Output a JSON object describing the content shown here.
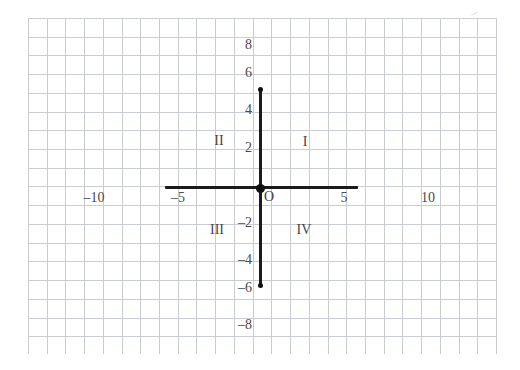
{
  "figure": {
    "background_color": "#ffffff",
    "grid_color": "#c9ccd2",
    "axis_color": "#1b1b1b",
    "label_color": "#4a4a4a"
  },
  "chart_data": {
    "type": "scatter",
    "title": "",
    "subtitle": "",
    "xlabel": "",
    "ylabel": "",
    "xlim": [
      -12.4,
      12.6
    ],
    "ylim": [
      -9.1,
      9.1
    ],
    "grid": true,
    "grid_spacing_units": 1,
    "legend": null,
    "origin_label": "O",
    "x_axis": {
      "drawn_from": -5,
      "drawn_to": 5,
      "tick_values": [
        -10,
        -5,
        5,
        10
      ],
      "tick_labels": [
        "–10",
        "–5",
        "5",
        "10"
      ]
    },
    "y_axis": {
      "drawn_from": -6,
      "drawn_to": 6,
      "tick_values": [
        8,
        6,
        4,
        2,
        -2,
        -4,
        -6,
        -8
      ],
      "tick_labels": [
        "8",
        "6",
        "4",
        "2",
        "–2",
        "–4",
        "–6",
        "–8"
      ]
    },
    "points": [
      {
        "x": 0,
        "y": 0,
        "label": "O",
        "style": "large-dot"
      },
      {
        "x": 0,
        "y": 6,
        "label": "",
        "style": "endpoint-dot"
      },
      {
        "x": 0,
        "y": -6,
        "label": "",
        "style": "endpoint-dot"
      }
    ],
    "annotations": [
      {
        "text": "I",
        "x": 2.4,
        "y": 2.6
      },
      {
        "text": "II",
        "x": -2.2,
        "y": 2.6
      },
      {
        "text": "III",
        "x": -2.3,
        "y": -2.3
      },
      {
        "text": "IV",
        "x": 2.3,
        "y": -2.3
      }
    ]
  },
  "x_ticks": [
    {
      "id": "x-minus-10",
      "text": "–10",
      "left": 78,
      "top": 191,
      "width": 32
    },
    {
      "id": "x-minus-5",
      "text": "–5",
      "left": 166,
      "top": 191,
      "width": 24
    },
    {
      "id": "x-plus-5",
      "text": "5",
      "left": 336,
      "top": 191,
      "width": 16
    },
    {
      "id": "x-plus-10",
      "text": "10",
      "left": 414,
      "top": 191,
      "width": 28
    }
  ],
  "y_ticks": [
    {
      "id": "y-plus-8",
      "text": "8",
      "left": 234,
      "top": 38,
      "width": 18
    },
    {
      "id": "y-plus-6",
      "text": "6",
      "left": 234,
      "top": 66,
      "width": 18
    },
    {
      "id": "y-plus-4",
      "text": "4",
      "left": 234,
      "top": 103,
      "width": 18
    },
    {
      "id": "y-plus-2",
      "text": "2",
      "left": 234,
      "top": 141,
      "width": 18
    },
    {
      "id": "y-minus-2",
      "text": "–2",
      "left": 228,
      "top": 216,
      "width": 24
    },
    {
      "id": "y-minus-4",
      "text": "–4",
      "left": 228,
      "top": 253,
      "width": 24
    },
    {
      "id": "y-minus-6",
      "text": "–6",
      "left": 228,
      "top": 281,
      "width": 24
    },
    {
      "id": "y-minus-8",
      "text": "–8",
      "left": 228,
      "top": 318,
      "width": 24
    }
  ],
  "quadrants": [
    {
      "id": "quadrant-1",
      "text": "I",
      "left": 296,
      "top": 135,
      "width": 18
    },
    {
      "id": "quadrant-2",
      "text": "II",
      "left": 209,
      "top": 134,
      "width": 20
    },
    {
      "id": "quadrant-3",
      "text": "III",
      "left": 205,
      "top": 223,
      "width": 24
    },
    {
      "id": "quadrant-4",
      "text": "IV",
      "left": 293,
      "top": 223,
      "width": 22
    }
  ],
  "origin": {
    "label": "O",
    "label_left": 264,
    "label_top": 190,
    "dot_cx": 260,
    "dot_cy": 188
  },
  "geometry": {
    "grid_left": 28,
    "grid_top": 18,
    "grid_right": 497,
    "grid_bottom": 354,
    "grid_step": 18.72,
    "x_axis_left": 165,
    "x_axis_right": 358,
    "x_axis_y": 186,
    "y_axis_x": 259,
    "y_axis_top": 88,
    "y_axis_bottom": 287
  }
}
